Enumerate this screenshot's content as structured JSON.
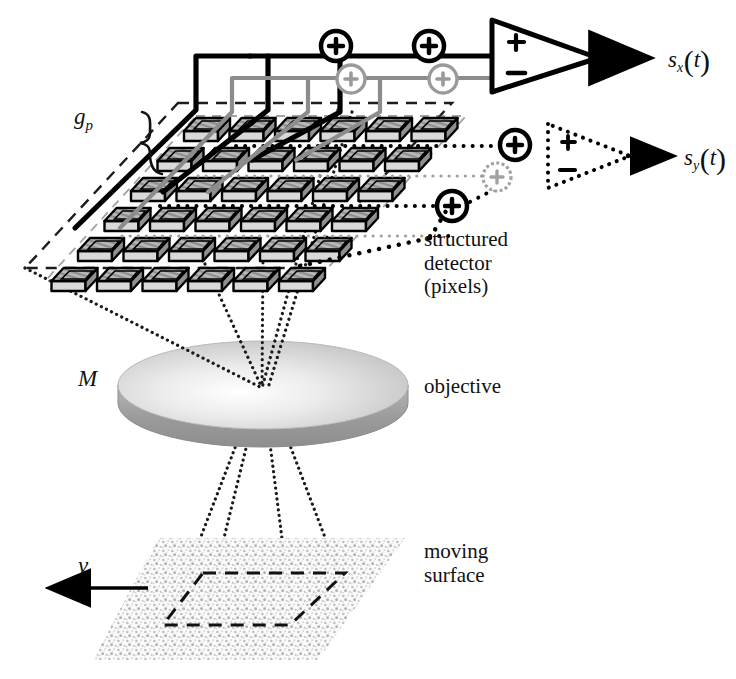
{
  "figure": {
    "background_color": "#ffffff",
    "width": 736,
    "height": 679
  },
  "labels": {
    "pixel_pitch": {
      "symbol": "g",
      "subscript": "p",
      "text": "g_p"
    },
    "magnification": {
      "symbol": "M",
      "text": "M"
    },
    "velocity": {
      "symbol": "v",
      "text": "v"
    },
    "detector": {
      "line1": "structured",
      "line2": "detector",
      "line3": "(pixels)"
    },
    "objective": {
      "text": "objective"
    },
    "surface": {
      "line1": "moving",
      "line2": "surface"
    },
    "signal_x": {
      "symbol": "s",
      "subscript": "x",
      "arg": "t",
      "open": "(",
      "close": ")"
    },
    "signal_y": {
      "symbol": "s",
      "subscript": "y",
      "arg": "t",
      "open": "(",
      "close": ")"
    }
  },
  "components": {
    "detector_array": {
      "name": "structured detector",
      "rows": 6,
      "columns": 6,
      "pixel_count": 36,
      "projection": "isometric",
      "pixel_top_fill": "#a8a8a8",
      "pixel_side_fill": "#d9d9d9",
      "pixel_outline": "#000000",
      "boundary_style": "dashed",
      "boundary_color": "#222222"
    },
    "objective_lens": {
      "name": "objective",
      "shape": "ellipse-disc",
      "top_fill_light": "#f2f2f2",
      "top_fill_dark": "#c4c4c4",
      "rim_fill": "#9a9a9a",
      "magnification_symbol": "M"
    },
    "moving_surface": {
      "name": "moving surface",
      "shape": "parallelogram",
      "texture": "speckle",
      "texture_color": "#b4b4b4",
      "field_outline_style": "dashed",
      "motion_direction": "left",
      "motion_symbol": "v"
    },
    "amplifier_x": {
      "name": "differential amplifier x",
      "shape": "triangle",
      "input_plus": "+",
      "input_minus": "−",
      "line_style": "solid",
      "color": "#000000",
      "output": "s_x(t)"
    },
    "amplifier_y": {
      "name": "differential amplifier y",
      "shape": "triangle",
      "input_plus": "+",
      "input_minus": "−",
      "line_style": "dotted",
      "color": "#000000",
      "output": "s_y(t)"
    }
  },
  "summing_junctions": {
    "symbol": "+",
    "shape": "circle",
    "x_branch_positive": {
      "count": 2,
      "color": "#000000",
      "style": "solid"
    },
    "x_branch_negative": {
      "count": 2,
      "color": "#8c8c8c",
      "style": "solid"
    },
    "y_branch_positive": {
      "count": 2,
      "color": "#000000",
      "style": "dotted"
    },
    "y_branch_negative": {
      "count": 1,
      "color": "#8c8c8c",
      "style": "dotted"
    }
  },
  "wiring": {
    "x_positive_bus": {
      "color": "#000000",
      "style": "solid",
      "width": 5
    },
    "x_negative_bus": {
      "color": "#8c8c8c",
      "style": "solid",
      "width": 4
    },
    "y_positive_bus": {
      "color": "#000000",
      "style": "dotted",
      "width": 4
    },
    "y_negative_bus": {
      "color": "#9e9e9e",
      "style": "dotted",
      "width": 3
    }
  },
  "optical_rays": {
    "style": "dotted",
    "color": "#1a1a1a",
    "detector_to_lens_rays": 4,
    "lens_to_surface_rays": 4
  },
  "colors": {
    "ink": "#000000",
    "gray_signal": "#8c8c8c",
    "light_gray": "#c4c4c4",
    "paper": "#ffffff"
  }
}
